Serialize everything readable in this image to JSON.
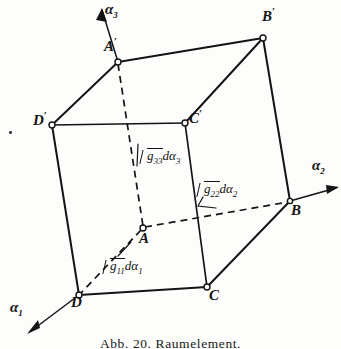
{
  "figure": {
    "caption": "Abb. 20. Raumelement.",
    "title": "Raumelement",
    "ink_color": "#141414",
    "paper_color": "#fdfdfb",
    "width": 341,
    "height": 349
  },
  "axes": [
    {
      "id": "alpha1",
      "label": "α",
      "sub": "1",
      "label_x": 10,
      "label_y": 300,
      "arrow": "down-left"
    },
    {
      "id": "alpha2",
      "label": "α",
      "sub": "2",
      "label_x": 312,
      "label_y": 158,
      "arrow": "right"
    },
    {
      "id": "alpha3",
      "label": "α",
      "sub": "3",
      "label_x": 105,
      "label_y": 2,
      "arrow": "up"
    }
  ],
  "vertices": [
    {
      "id": "Aprime",
      "label": "A",
      "prime": "′",
      "x": 118,
      "y": 62,
      "label_x": 104,
      "label_y": 36,
      "hidden": false
    },
    {
      "id": "Bprime",
      "label": "B",
      "prime": "′",
      "x": 263,
      "y": 38,
      "label_x": 262,
      "label_y": 6,
      "hidden": false
    },
    {
      "id": "Cprime",
      "label": "C",
      "prime": "′",
      "x": 185,
      "y": 123,
      "label_x": 189,
      "label_y": 108,
      "hidden": false
    },
    {
      "id": "Dprime",
      "label": "D",
      "prime": "′",
      "x": 52,
      "y": 125,
      "label_x": 33,
      "label_y": 110,
      "hidden": false
    },
    {
      "id": "A",
      "label": "A",
      "prime": "",
      "x": 143,
      "y": 228,
      "label_x": 139,
      "label_y": 228,
      "hidden": true
    },
    {
      "id": "B",
      "label": "B",
      "prime": "",
      "x": 290,
      "y": 201,
      "label_x": 291,
      "label_y": 200,
      "hidden": false
    },
    {
      "id": "C",
      "label": "C",
      "prime": "",
      "x": 207,
      "y": 287,
      "label_x": 209,
      "label_y": 285,
      "hidden": false
    },
    {
      "id": "D",
      "label": "D",
      "prime": "",
      "x": 79,
      "y": 295,
      "label_x": 71,
      "label_y": 292,
      "hidden": false
    }
  ],
  "edges": [
    {
      "id": "Aprime-Bprime",
      "from": "Aprime",
      "to": "Bprime",
      "style": "solid"
    },
    {
      "id": "Aprime-Dprime",
      "from": "Aprime",
      "to": "Dprime",
      "style": "solid"
    },
    {
      "id": "Bprime-Cprime",
      "from": "Bprime",
      "to": "Cprime",
      "style": "solid"
    },
    {
      "id": "Dprime-Cprime",
      "from": "Dprime",
      "to": "Cprime",
      "style": "solid"
    },
    {
      "id": "Dprime-D",
      "from": "Dprime",
      "to": "D",
      "style": "solid"
    },
    {
      "id": "Cprime-C",
      "from": "Cprime",
      "to": "C",
      "style": "solid"
    },
    {
      "id": "Bprime-B",
      "from": "Bprime",
      "to": "B",
      "style": "solid"
    },
    {
      "id": "D-C",
      "from": "D",
      "to": "C",
      "style": "solid"
    },
    {
      "id": "C-B",
      "from": "C",
      "to": "B",
      "style": "solid"
    },
    {
      "id": "Aprime-A",
      "from": "Aprime",
      "to": "A",
      "style": "dashed"
    },
    {
      "id": "A-D",
      "from": "A",
      "to": "D",
      "style": "dashed"
    },
    {
      "id": "A-B",
      "from": "A",
      "to": "B",
      "style": "dashed"
    }
  ],
  "measure_labels": [
    {
      "id": "g11",
      "radicand": "g",
      "radicand_sub": "11",
      "differential": "dα",
      "diff_sub": "1",
      "text": "√g₁₁ dα₁",
      "x": 103,
      "y": 258,
      "edge": "A-D",
      "leader": {
        "x1": 118,
        "y1": 255,
        "x2": 130,
        "y2": 243
      }
    },
    {
      "id": "g22",
      "radicand": "g",
      "radicand_sub": "22",
      "differential": "dα",
      "diff_sub": "2",
      "text": "√g₂₂ dα₂",
      "x": 197,
      "y": 181,
      "edge": "A-B",
      "leader": {
        "x1": 205,
        "y1": 199,
        "x2": 218,
        "y2": 207
      }
    },
    {
      "id": "g33",
      "radicand": "g",
      "radicand_sub": "33",
      "differential": "dα",
      "diff_sub": "3",
      "text": "√g₃₃ dα₃",
      "x": 140,
      "y": 148,
      "edge": "Aprime-A",
      "leader": {
        "x1": 138,
        "y1": 146,
        "x2": 138,
        "y2": 163
      }
    }
  ],
  "stray_marks": [
    {
      "id": "ink-dot",
      "x": 9,
      "y": 131
    }
  ],
  "caption_position": {
    "x": 0,
    "y": 336
  }
}
